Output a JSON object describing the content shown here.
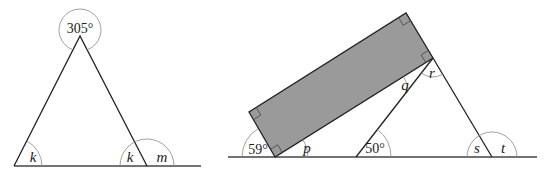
{
  "figure_left": {
    "apex_angle": "305°",
    "base_left_angle": "k",
    "base_right_interior_angle": "k",
    "base_right_exterior_angle": "m"
  },
  "figure_right": {
    "rectangle_angle_left": "59°",
    "angle_p": "p",
    "angle_q": "q",
    "angle_r": "r",
    "angle_50": "50°",
    "angle_s": "s",
    "angle_t": "t"
  }
}
